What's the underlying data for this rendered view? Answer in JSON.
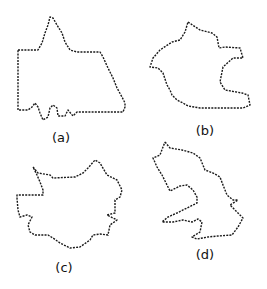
{
  "figure": {
    "panels": [
      {
        "id": "a",
        "label": "(a)",
        "label_pos": [
          61,
          131
        ],
        "points": [
          [
            18,
            50
          ],
          [
            38,
            50
          ],
          [
            42,
            43
          ],
          [
            45,
            33
          ],
          [
            48,
            25
          ],
          [
            50,
            17
          ],
          [
            53,
            18
          ],
          [
            57,
            25
          ],
          [
            62,
            33
          ],
          [
            65,
            42
          ],
          [
            70,
            50
          ],
          [
            77,
            52
          ],
          [
            100,
            52
          ],
          [
            103,
            57
          ],
          [
            108,
            68
          ],
          [
            113,
            78
          ],
          [
            117,
            88
          ],
          [
            122,
            97
          ],
          [
            125,
            103
          ],
          [
            125,
            107
          ],
          [
            123,
            112
          ],
          [
            77,
            112
          ],
          [
            73,
            116
          ],
          [
            68,
            110
          ],
          [
            65,
            116
          ],
          [
            58,
            116
          ],
          [
            57,
            108
          ],
          [
            53,
            105
          ],
          [
            50,
            108
          ],
          [
            48,
            117
          ],
          [
            43,
            120
          ],
          [
            40,
            113
          ],
          [
            38,
            107
          ],
          [
            35,
            103
          ],
          [
            32,
            107
          ],
          [
            28,
            110
          ],
          [
            18,
            110
          ],
          [
            18,
            103
          ],
          [
            18,
            50
          ]
        ]
      },
      {
        "id": "b",
        "label": "(b)",
        "label_pos": [
          205,
          124
        ],
        "points": [
          [
            188,
            22
          ],
          [
            200,
            30
          ],
          [
            212,
            33
          ],
          [
            217,
            37
          ],
          [
            219,
            48
          ],
          [
            225,
            47
          ],
          [
            240,
            48
          ],
          [
            243,
            58
          ],
          [
            233,
            58
          ],
          [
            223,
            67
          ],
          [
            220,
            82
          ],
          [
            225,
            90
          ],
          [
            242,
            93
          ],
          [
            248,
            95
          ],
          [
            250,
            105
          ],
          [
            243,
            108
          ],
          [
            200,
            108
          ],
          [
            188,
            106
          ],
          [
            183,
            103
          ],
          [
            177,
            100
          ],
          [
            172,
            95
          ],
          [
            170,
            90
          ],
          [
            167,
            85
          ],
          [
            163,
            73
          ],
          [
            158,
            68
          ],
          [
            150,
            67
          ],
          [
            153,
            58
          ],
          [
            160,
            50
          ],
          [
            172,
            42
          ],
          [
            180,
            40
          ],
          [
            185,
            32
          ],
          [
            188,
            22
          ]
        ]
      },
      {
        "id": "c",
        "label": "(c)",
        "label_pos": [
          64,
          261
        ],
        "points": [
          [
            33,
            167
          ],
          [
            38,
            173
          ],
          [
            50,
            175
          ],
          [
            53,
            178
          ],
          [
            75,
            177
          ],
          [
            83,
            173
          ],
          [
            88,
            168
          ],
          [
            95,
            160
          ],
          [
            100,
            163
          ],
          [
            107,
            175
          ],
          [
            117,
            180
          ],
          [
            122,
            190
          ],
          [
            120,
            197
          ],
          [
            115,
            200
          ],
          [
            115,
            213
          ],
          [
            107,
            215
          ],
          [
            117,
            220
          ],
          [
            110,
            225
          ],
          [
            108,
            235
          ],
          [
            100,
            234
          ],
          [
            93,
            235
          ],
          [
            90,
            240
          ],
          [
            80,
            247
          ],
          [
            70,
            248
          ],
          [
            60,
            243
          ],
          [
            53,
            238
          ],
          [
            48,
            235
          ],
          [
            35,
            235
          ],
          [
            30,
            232
          ],
          [
            28,
            225
          ],
          [
            32,
            217
          ],
          [
            27,
            215
          ],
          [
            20,
            217
          ],
          [
            18,
            210
          ],
          [
            17,
            198
          ],
          [
            17,
            195
          ],
          [
            43,
            195
          ],
          [
            43,
            190
          ],
          [
            40,
            182
          ],
          [
            37,
            175
          ],
          [
            33,
            167
          ]
        ]
      },
      {
        "id": "d",
        "label": "(d)",
        "label_pos": [
          205,
          248
        ],
        "points": [
          [
            165,
            142
          ],
          [
            170,
            148
          ],
          [
            182,
            150
          ],
          [
            193,
            153
          ],
          [
            200,
            158
          ],
          [
            205,
            170
          ],
          [
            213,
            173
          ],
          [
            220,
            177
          ],
          [
            223,
            185
          ],
          [
            227,
            195
          ],
          [
            233,
            200
          ],
          [
            238,
            200
          ],
          [
            230,
            205
          ],
          [
            237,
            212
          ],
          [
            243,
            218
          ],
          [
            238,
            227
          ],
          [
            232,
            235
          ],
          [
            218,
            236
          ],
          [
            208,
            237
          ],
          [
            197,
            239
          ],
          [
            192,
            237
          ],
          [
            200,
            232
          ],
          [
            202,
            222
          ],
          [
            198,
            219
          ],
          [
            192,
            222
          ],
          [
            183,
            220
          ],
          [
            173,
            222
          ],
          [
            162,
            222
          ],
          [
            168,
            217
          ],
          [
            177,
            213
          ],
          [
            187,
            208
          ],
          [
            197,
            203
          ],
          [
            197,
            197
          ],
          [
            193,
            190
          ],
          [
            187,
            185
          ],
          [
            180,
            186
          ],
          [
            170,
            191
          ],
          [
            167,
            185
          ],
          [
            162,
            175
          ],
          [
            157,
            167
          ],
          [
            153,
            158
          ],
          [
            160,
            155
          ],
          [
            163,
            147
          ],
          [
            165,
            142
          ]
        ]
      }
    ]
  }
}
